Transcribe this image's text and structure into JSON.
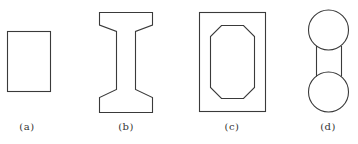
{
  "figure": {
    "stroke_color": "#3a3a3a",
    "background": "#ffffff",
    "panels": [
      {
        "id": "a",
        "label": "(a)",
        "shape": "solid rectangle section",
        "label_x": 27
      },
      {
        "id": "b",
        "label": "(b)",
        "shape": "I-beam section with haunched flanges",
        "label_x": 126
      },
      {
        "id": "c",
        "label": "(c)",
        "shape": "box section with octagonal void",
        "label_x": 232
      },
      {
        "id": "d",
        "label": "(d)",
        "shape": "dumbbell section (two circles joined by web)",
        "label_x": 328
      }
    ]
  }
}
